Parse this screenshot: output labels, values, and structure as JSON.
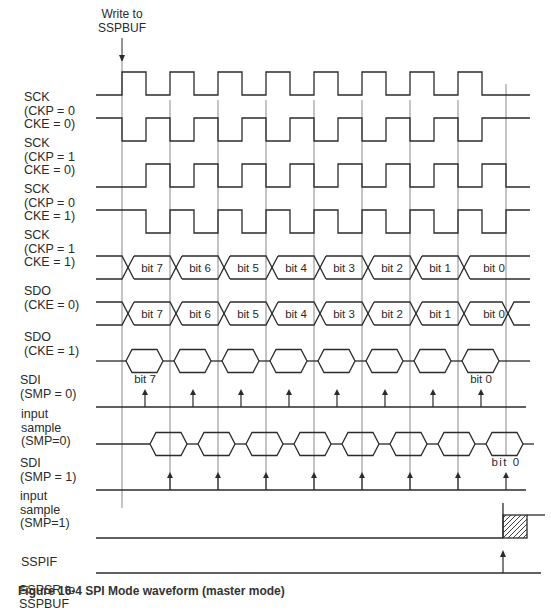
{
  "title": "SPI mode waveform (master mode)",
  "write_marker": {
    "line1": "Write to",
    "line2": "SSPBUF"
  },
  "signals": [
    {
      "id": "sck1",
      "lines": [
        "SCK",
        "(CKP = 0",
        "CKE = 0)"
      ],
      "type": "clock",
      "idle": "low",
      "start": 122
    },
    {
      "id": "sck2",
      "lines": [
        "SCK",
        "(CKP = 1",
        "CKE = 0)"
      ],
      "type": "clock",
      "idle": "high",
      "start": 122
    },
    {
      "id": "sck3",
      "lines": [
        "SCK",
        "(CKP = 0",
        "CKE = 1)"
      ],
      "type": "clock",
      "idle": "low",
      "start": 146
    },
    {
      "id": "sck4",
      "lines": [
        "SCK",
        "(CKP = 1",
        "CKE = 1)"
      ],
      "type": "clock",
      "idle": "high",
      "start": 146
    },
    {
      "id": "sdo1",
      "lines": [
        "SDO",
        "(CKE = 0)"
      ],
      "type": "bus",
      "bits": [
        "bit 7",
        "bit 6",
        "bit 5",
        "bit 4",
        "bit 3",
        "bit 2",
        "bit 1",
        "bit 0"
      ]
    },
    {
      "id": "sdo2",
      "lines": [
        "SDO",
        "(CKE = 1)"
      ],
      "type": "bus",
      "bits": [
        "bit 7",
        "bit 6",
        "bit 5",
        "bit 4",
        "bit 3",
        "bit 2",
        "bit 1",
        "bit 0"
      ]
    },
    {
      "id": "sdi1",
      "lines": [
        "SDI",
        "(SMP = 0)"
      ],
      "type": "hex"
    },
    {
      "id": "smp0",
      "lines": [
        "input",
        "sample",
        "(SMP=0)"
      ],
      "type": "sample",
      "first_label": "bit 7",
      "last_label": "bit 0"
    },
    {
      "id": "sdi2",
      "lines": [
        "SDI",
        "(SMP = 1)"
      ],
      "type": "hex"
    },
    {
      "id": "smp1",
      "lines": [
        "input",
        "sample",
        "(SMP=1)"
      ],
      "type": "sample",
      "last_label": "bit 0"
    },
    {
      "id": "sspif",
      "lines": [
        "SSPIF"
      ],
      "type": "flag"
    },
    {
      "id": "sspsr",
      "lines": [
        "SSPSR to",
        "SSPBUF"
      ],
      "type": "transfer"
    }
  ],
  "caption": "Figure 16-4     SPI Mode waveform (master mode)",
  "colors": {
    "line": "#2b2b2b",
    "grid": "#6a6a6a",
    "background": "#ffffff"
  }
}
